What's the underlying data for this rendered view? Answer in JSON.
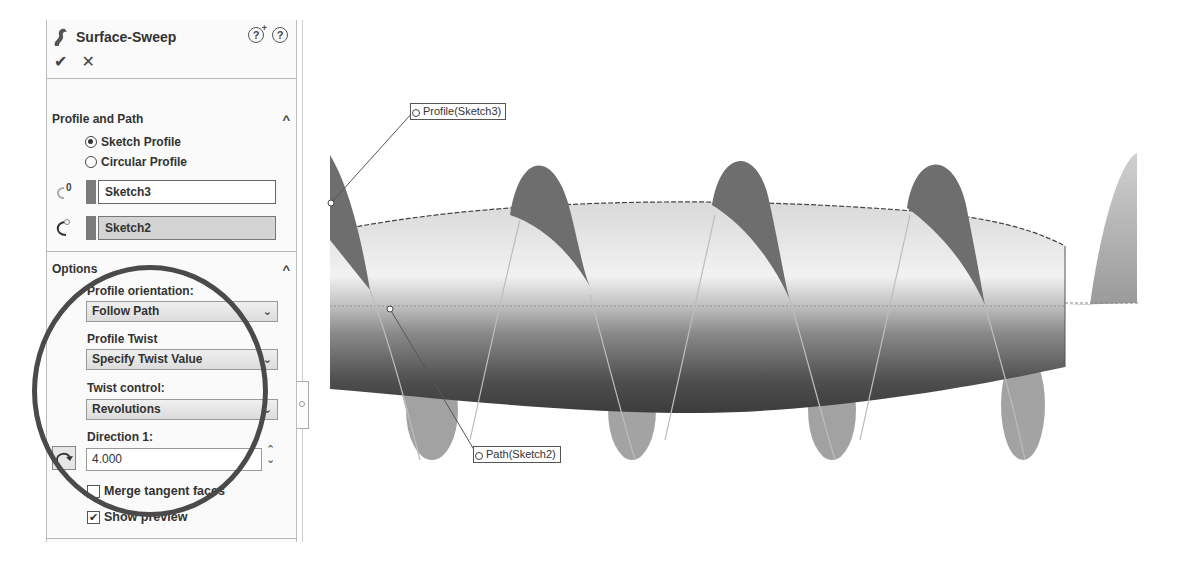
{
  "property_manager": {
    "title": "Surface-Sweep",
    "help_icons": [
      "?",
      "?"
    ],
    "ok_label": "✔",
    "cancel_label": "✕",
    "sections": {
      "profile_and_path": {
        "header": "Profile and Path",
        "collapse_icon": "^",
        "radio_options": [
          {
            "label": "Sketch Profile",
            "checked": true
          },
          {
            "label": "Circular Profile",
            "checked": false
          }
        ],
        "profile_selection": "Sketch3",
        "path_selection": "Sketch2"
      },
      "options": {
        "header": "Options",
        "collapse_icon": "^",
        "profile_orientation_label": "Profile orientation:",
        "profile_orientation_value": "Follow Path",
        "profile_twist_label": "Profile Twist",
        "profile_twist_value": "Specify Twist Value",
        "twist_control_label": "Twist control:",
        "twist_control_value": "Revolutions",
        "direction_label": "Direction 1:",
        "direction_value": "4.000",
        "dropdown_arrow": "⌄",
        "spinner_up": "⌃",
        "spinner_down": "⌄",
        "merge_tangent_faces": {
          "label": "Merge tangent faces",
          "checked": false
        },
        "show_preview": {
          "label": "Show preview",
          "checked": true,
          "check_glyph": "✔"
        }
      }
    }
  },
  "viewport": {
    "callouts": {
      "profile": "Profile(Sketch3)",
      "path": "Path(Sketch2)"
    },
    "colors": {
      "body_light": "#e8e8e8",
      "body_dark": "#4a4a4a",
      "helix_fill": "#8a8a8a",
      "helix_dark": "#5a5a5a"
    }
  }
}
